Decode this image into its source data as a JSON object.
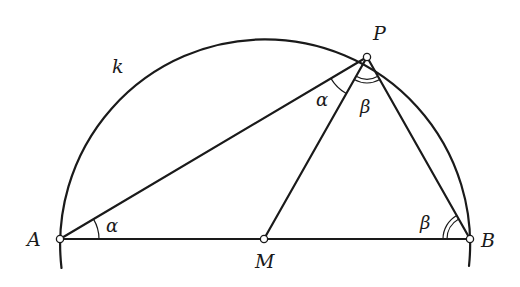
{
  "diagram": {
    "type": "geometry",
    "colors": {
      "stroke": "#1a1a1a",
      "background": "#ffffff",
      "point_fill": "#ffffff"
    },
    "circle": {
      "label": "k",
      "center": "M"
    },
    "points": {
      "A": {
        "label": "A"
      },
      "B": {
        "label": "B"
      },
      "M": {
        "label": "M"
      },
      "P": {
        "label": "P"
      }
    },
    "segments": [
      "AB",
      "AP",
      "MP",
      "BP"
    ],
    "angles": {
      "alpha_at_A": {
        "label": "α",
        "vertex": "A",
        "style": "single-arc"
      },
      "alpha_at_P": {
        "label": "α",
        "vertex": "P",
        "style": "single-arc"
      },
      "beta_at_P": {
        "label": "β",
        "vertex": "P",
        "style": "double-arc"
      },
      "beta_at_B": {
        "label": "β",
        "vertex": "B",
        "style": "double-arc"
      }
    }
  }
}
